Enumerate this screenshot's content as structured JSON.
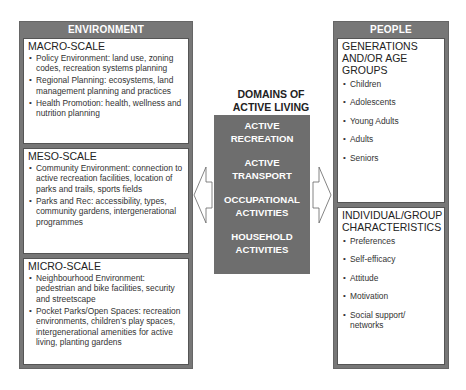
{
  "environment": {
    "title": "ENVIRONMENT",
    "macro": {
      "title": "MACRO-SCALE",
      "items": [
        "Policy Environment: land use, zoning codes, recreation systems planning",
        "Regional Planning: ecosystems, land management planning and practices",
        "Health Promotion: health, wellness and nutrition planning"
      ]
    },
    "meso": {
      "title": "MESO-SCALE",
      "items": [
        "Community Environment: connection to active recreation facilities, location of parks and trails, sports fields",
        "Parks and Rec: accessibility, types, community gardens, intergenerational programmes"
      ]
    },
    "micro": {
      "title": "MICRO-SCALE",
      "items": [
        "Neighbourhood Environment: pedestrian and bike facilities, security and streetscape",
        "Pocket Parks/Open Spaces: recreation environments, children’s play spaces, intergenerational amenities for active living, planting gardens"
      ]
    }
  },
  "domains": {
    "title": "DOMAINS OF ACTIVE LIVING",
    "items": [
      "ACTIVE RECREATION",
      "ACTIVE TRANSPORT",
      "OCCUPATIONAL ACTIVITIES",
      "HOUSEHOLD ACTIVITIES"
    ]
  },
  "people": {
    "title": "PEOPLE",
    "generations": {
      "title": "GENERATIONS AND/OR AGE GROUPS",
      "items": [
        "Children",
        "Adolescents",
        "Young Adults",
        "Adults",
        "Seniors"
      ]
    },
    "characteristics": {
      "title": "INDIVIDUAL/GROUP CHARACTERISTICS",
      "items": [
        "Preferences",
        "Self-efficacy",
        "Attitude",
        "Motivation",
        "Social support/ networks"
      ]
    }
  },
  "arrows": {
    "left": "arrow-left-icon",
    "right": "arrow-right-icon"
  }
}
